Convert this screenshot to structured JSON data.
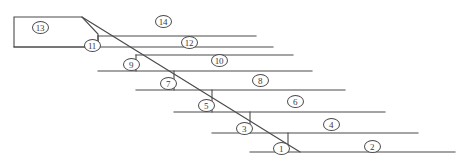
{
  "figure": {
    "kind": "line-diagram",
    "title": "",
    "width": 466,
    "height": 165,
    "background_color": "#ffffff",
    "stroke_color": "#4a4a4a",
    "label_text_color": "#3a3a3a",
    "label_style": "circled-number"
  },
  "labels": [
    {
      "id": "label-1",
      "text": "1",
      "x": 281,
      "y": 148,
      "region": "step-face-1"
    },
    {
      "id": "label-2",
      "text": "2",
      "x": 372,
      "y": 146,
      "region": "band-2"
    },
    {
      "id": "label-3",
      "text": "3",
      "x": 244,
      "y": 128,
      "region": "step-face-3"
    },
    {
      "id": "label-4",
      "text": "4",
      "x": 331,
      "y": 124,
      "region": "band-4"
    },
    {
      "id": "label-5",
      "text": "5",
      "x": 206,
      "y": 105,
      "region": "step-face-5"
    },
    {
      "id": "label-6",
      "text": "6",
      "x": 295,
      "y": 101,
      "region": "band-6"
    },
    {
      "id": "label-7",
      "text": "7",
      "x": 168,
      "y": 83,
      "region": "step-face-7"
    },
    {
      "id": "label-8",
      "text": "8",
      "x": 260,
      "y": 80,
      "region": "band-8"
    },
    {
      "id": "label-9",
      "text": "9",
      "x": 131,
      "y": 64,
      "region": "step-face-9"
    },
    {
      "id": "label-10",
      "text": "10",
      "x": 219,
      "y": 60,
      "region": "band-10"
    },
    {
      "id": "label-11",
      "text": "11",
      "x": 92,
      "y": 45,
      "region": "step-face-11"
    },
    {
      "id": "label-12",
      "text": "12",
      "x": 189,
      "y": 42,
      "region": "band-12"
    },
    {
      "id": "label-13",
      "text": "13",
      "x": 40,
      "y": 27,
      "region": "top-block-13"
    },
    {
      "id": "label-14",
      "text": "14",
      "x": 163,
      "y": 21,
      "region": "band-14"
    }
  ],
  "geometry": {
    "top_block": {
      "name": "top-block-13",
      "points": "14,17 82,17 98,34 98,47 14,47"
    },
    "diagonal": {
      "name": "main-diagonal",
      "x1": 82,
      "y1": 17,
      "x2": 300,
      "y2": 152
    },
    "bands": [
      {
        "name": "band-14",
        "y": 36,
        "x_start": 98,
        "x_end": 256
      },
      {
        "name": "band-12",
        "y": 47,
        "x_start": 14,
        "x_end": 273
      },
      {
        "name": "band-10",
        "y": 55,
        "x_start": 136,
        "x_end": 293
      },
      {
        "name": "band-8",
        "y": 71,
        "x_start": 98,
        "x_end": 312
      },
      {
        "name": "band-6",
        "y": 90,
        "x_start": 136,
        "x_end": 345
      },
      {
        "name": "band-4",
        "y": 112,
        "x_start": 174,
        "x_end": 385
      },
      {
        "name": "band-2",
        "y": 133,
        "x_start": 212,
        "x_end": 418
      },
      {
        "name": "band-base",
        "y": 152,
        "x_start": 250,
        "x_end": 455
      }
    ],
    "step_risers": [
      {
        "name": "riser-11",
        "x": 98,
        "y1": 36,
        "y2": 47
      },
      {
        "name": "riser-9",
        "x": 136,
        "y1": 55,
        "y2": 71
      },
      {
        "name": "riser-7",
        "x": 174,
        "y1": 71,
        "y2": 90
      },
      {
        "name": "riser-5",
        "x": 212,
        "y1": 90,
        "y2": 112
      },
      {
        "name": "riser-3",
        "x": 250,
        "y1": 112,
        "y2": 133
      },
      {
        "name": "riser-1",
        "x": 288,
        "y1": 133,
        "y2": 152
      }
    ]
  }
}
